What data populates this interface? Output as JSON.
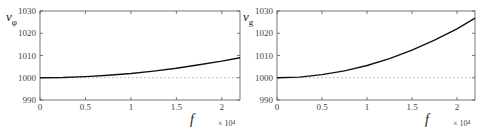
{
  "chart_data": [
    {
      "type": "line",
      "ylabel": "v_φ",
      "ylabel_main": "v",
      "ylabel_sub": "φ",
      "xlabel": "f",
      "x_multiplier": "× 10⁴",
      "xlim": [
        0,
        2.2
      ],
      "ylim": [
        990,
        1030
      ],
      "xticks": [
        "0",
        "0.5",
        "1",
        "1.5",
        "2"
      ],
      "yticks": [
        "990",
        "1000",
        "1010",
        "1020",
        "1030"
      ],
      "reference_line": {
        "y": 1000,
        "style": "dotted"
      },
      "series": [
        {
          "name": "v_phi",
          "x": [
            0,
            0.25,
            0.5,
            0.75,
            1.0,
            1.25,
            1.5,
            1.75,
            2.0,
            2.2
          ],
          "values": [
            1000,
            1000.1,
            1000.5,
            1001.1,
            1001.9,
            1003.0,
            1004.3,
            1005.8,
            1007.5,
            1009.0
          ]
        }
      ]
    },
    {
      "type": "line",
      "ylabel": "v_g",
      "ylabel_main": "v",
      "ylabel_sub": "g",
      "xlabel": "f",
      "x_multiplier": "× 10⁴",
      "xlim": [
        0,
        2.2
      ],
      "ylim": [
        990,
        1030
      ],
      "xticks": [
        "0",
        "0.5",
        "1",
        "1.5",
        "2"
      ],
      "yticks": [
        "990",
        "1000",
        "1010",
        "1020",
        "1030"
      ],
      "reference_line": {
        "y": 1000,
        "style": "dotted"
      },
      "series": [
        {
          "name": "v_g",
          "x": [
            0,
            0.25,
            0.5,
            0.75,
            1.0,
            1.25,
            1.5,
            1.75,
            2.0,
            2.2
          ],
          "values": [
            1000,
            1000.3,
            1001.4,
            1003.1,
            1005.5,
            1008.6,
            1012.4,
            1016.9,
            1022.0,
            1026.8
          ]
        }
      ]
    }
  ]
}
